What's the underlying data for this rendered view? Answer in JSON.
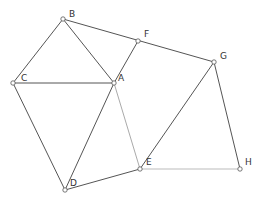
{
  "diagram": {
    "points": [
      {
        "id": "B",
        "x": 63,
        "y": 19,
        "lx": 69,
        "ly": 17
      },
      {
        "id": "C",
        "x": 13,
        "y": 83,
        "lx": 21,
        "ly": 81
      },
      {
        "id": "A",
        "x": 114,
        "y": 83,
        "lx": 118,
        "ly": 81
      },
      {
        "id": "F",
        "x": 138,
        "y": 41,
        "lx": 144,
        "ly": 37
      },
      {
        "id": "G",
        "x": 214,
        "y": 62,
        "lx": 220,
        "ly": 59
      },
      {
        "id": "D",
        "x": 65,
        "y": 190,
        "lx": 70,
        "ly": 186
      },
      {
        "id": "E",
        "x": 140,
        "y": 169,
        "lx": 146,
        "ly": 165
      },
      {
        "id": "H",
        "x": 240,
        "y": 169,
        "lx": 245,
        "ly": 165
      }
    ],
    "segments": [
      {
        "from": "B",
        "to": "C",
        "color": "#555"
      },
      {
        "from": "B",
        "to": "A",
        "color": "#555"
      },
      {
        "from": "B",
        "to": "G",
        "color": "#555"
      },
      {
        "from": "C",
        "to": "A",
        "color": "#555"
      },
      {
        "from": "C",
        "to": "D",
        "color": "#555"
      },
      {
        "from": "A",
        "to": "D",
        "color": "#555"
      },
      {
        "from": "A",
        "to": "F",
        "color": "#555"
      },
      {
        "from": "A",
        "to": "E",
        "color": "#aaa"
      },
      {
        "from": "D",
        "to": "E",
        "color": "#555"
      },
      {
        "from": "E",
        "to": "G",
        "color": "#555"
      },
      {
        "from": "G",
        "to": "H",
        "color": "#555"
      },
      {
        "from": "E",
        "to": "H",
        "color": "#bbb"
      }
    ]
  }
}
